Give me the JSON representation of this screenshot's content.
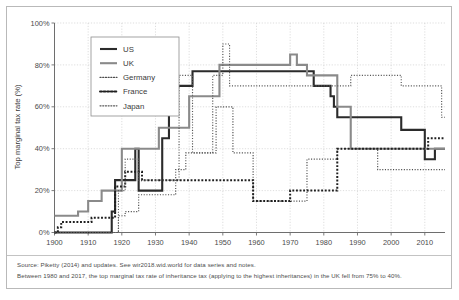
{
  "figure": {
    "notes": [
      "Source: Piketty (2014) and updates. See wir2018.wid.world for data series and notes.",
      "Between 1980 and 2017, the top marginal tax rate of inheritance tax (applying to the highest inheritances) in the UK fell from 75% to 40%."
    ]
  },
  "chart_data": {
    "type": "line",
    "title": "",
    "xlabel": "",
    "ylabel": "Top marginal tax rate (%)",
    "xlim": [
      1900,
      2016
    ],
    "ylim": [
      0,
      100
    ],
    "grid": true,
    "legend_position": "top-left",
    "xticks": [
      1900,
      1910,
      1920,
      1930,
      1940,
      1950,
      1960,
      1970,
      1980,
      1990,
      2000,
      2010
    ],
    "xtick_labels": [
      "1900",
      "1910",
      "1920",
      "1930",
      "1940",
      "1950",
      "1960",
      "1970",
      "1980",
      "1990",
      "2000",
      "2010"
    ],
    "yticks": [
      0,
      20,
      40,
      60,
      80,
      100
    ],
    "ytick_labels": [
      "0%",
      "20%",
      "40%",
      "60%",
      "80%",
      "100%"
    ],
    "series": [
      {
        "name": "US",
        "color": "#2b2b2b",
        "width": 2.1,
        "dash": "",
        "step": true,
        "x": [
          1900,
          1916,
          1917,
          1918,
          1919,
          1923,
          1924,
          1925,
          1926,
          1931,
          1932,
          1934,
          1935,
          1936,
          1940,
          1941,
          1942,
          1954,
          1977,
          1981,
          1982,
          1983,
          1984,
          2002,
          2003,
          2010,
          2011,
          2013,
          2016
        ],
        "y": [
          0,
          0,
          10,
          25,
          25,
          25,
          40,
          20,
          20,
          20,
          45,
          60,
          70,
          70,
          70,
          77,
          77,
          77,
          70,
          70,
          65,
          60,
          55,
          55,
          49,
          35,
          35,
          40,
          40
        ]
      },
      {
        "name": "UK",
        "color": "#8a8a8a",
        "width": 2.1,
        "dash": "",
        "step": true,
        "x": [
          1900,
          1906,
          1907,
          1909,
          1910,
          1914,
          1919,
          1920,
          1930,
          1931,
          1939,
          1940,
          1946,
          1949,
          1969,
          1970,
          1972,
          1975,
          1976,
          1983,
          1984,
          1985,
          1988,
          2016
        ],
        "y": [
          8,
          8,
          10,
          10,
          15,
          20,
          20,
          40,
          40,
          50,
          50,
          65,
          65,
          80,
          80,
          85,
          80,
          75,
          75,
          75,
          60,
          60,
          40,
          40
        ]
      },
      {
        "name": "Germany",
        "color": "#4d4d4d",
        "width": 1.15,
        "dash": "1.1 1.6",
        "step": true,
        "x": [
          1900,
          1918,
          1919,
          1920,
          1921,
          1924,
          1925,
          1927,
          1932,
          1935,
          1936,
          1938,
          1939,
          1946,
          1948,
          1949,
          1952,
          1953,
          1958,
          1959,
          1974,
          1975,
          1983,
          1984,
          1995,
          1996,
          2016
        ],
        "y": [
          0,
          0,
          8,
          8,
          10,
          10,
          18,
          18,
          18,
          18,
          30,
          30,
          38,
          38,
          60,
          60,
          60,
          38,
          38,
          15,
          15,
          35,
          35,
          40,
          40,
          30,
          30
        ]
      },
      {
        "name": "France",
        "color": "#1f1f1f",
        "width": 2.0,
        "dash": "1.9 1.7",
        "step": true,
        "x": [
          1900,
          1901,
          1902,
          1910,
          1911,
          1917,
          1918,
          1920,
          1921,
          1925,
          1926,
          1928,
          1929,
          1934,
          1935,
          1958,
          1959,
          1969,
          1970,
          1983,
          1984,
          2010,
          2011,
          2016
        ],
        "y": [
          0,
          2.5,
          5,
          5,
          7,
          7,
          22,
          22,
          29,
          29,
          25,
          25,
          25,
          25,
          25,
          25,
          15,
          15,
          20,
          20,
          40,
          40,
          45,
          45
        ]
      },
      {
        "name": "Japan",
        "color": "#585858",
        "width": 1.15,
        "dash": "1.1 1.6",
        "step": true,
        "x": [
          1900,
          1918,
          1919,
          1920,
          1921,
          1924,
          1925,
          1927,
          1936,
          1937,
          1940,
          1941,
          1946,
          1947,
          1949,
          1950,
          1951,
          1952,
          1953,
          1987,
          1988,
          2002,
          2003,
          2014,
          2015,
          2016
        ],
        "y": [
          0,
          0,
          20,
          20,
          35,
          35,
          25,
          25,
          25,
          75,
          75,
          38,
          38,
          75,
          75,
          90,
          90,
          70,
          70,
          70,
          75,
          75,
          70,
          70,
          55,
          55
        ]
      }
    ],
    "legend_entries": [
      {
        "label": "US",
        "style": "thick-solid-dark"
      },
      {
        "label": "UK",
        "style": "thick-solid-gray"
      },
      {
        "label": "Germany",
        "style": "fine-dotted"
      },
      {
        "label": "France",
        "style": "bold-dotted"
      },
      {
        "label": "Japan",
        "style": "fine-dotted"
      }
    ]
  }
}
